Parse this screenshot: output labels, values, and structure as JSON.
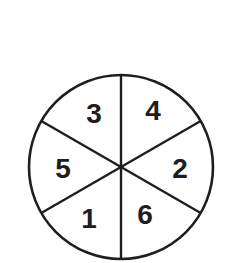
{
  "diagram": {
    "type": "spinner",
    "colors": {
      "background": "#ffffff",
      "stroke": "#1e1e1e",
      "text": "#1e1e1e"
    },
    "sectors": [
      {
        "position": "top-left",
        "label": "3"
      },
      {
        "position": "top-right",
        "label": "4"
      },
      {
        "position": "right",
        "label": "2"
      },
      {
        "position": "bottom-right",
        "label": "6"
      },
      {
        "position": "bottom-left",
        "label": "1"
      },
      {
        "position": "left",
        "label": "5"
      }
    ]
  }
}
